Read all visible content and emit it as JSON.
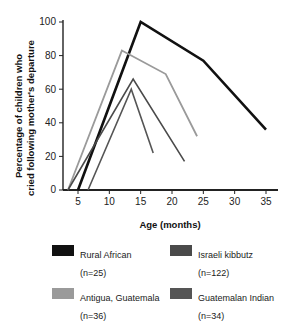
{
  "chart_data": {
    "type": "line",
    "title": "",
    "xlabel": "Age (months)",
    "ylabel": "Percentage of children who cried following mother's departure",
    "xlim": [
      2,
      36
    ],
    "ylim": [
      0,
      100
    ],
    "xticks": [
      5,
      10,
      15,
      20,
      25,
      30,
      35
    ],
    "yticks": [
      0,
      20,
      40,
      60,
      80,
      100
    ],
    "grid": false,
    "legend_position": "bottom",
    "series": [
      {
        "name": "Rural African",
        "n_label": "(n=25)",
        "color": "#111111",
        "width": 2.6,
        "points": [
          [
            5,
            0
          ],
          [
            15,
            100
          ],
          [
            25,
            77
          ],
          [
            35,
            36
          ]
        ]
      },
      {
        "name": "Antigua, Guatemala",
        "n_label": "(n=36)",
        "color": "#9a9a9a",
        "width": 1.8,
        "points": [
          [
            3.4,
            0
          ],
          [
            12,
            83
          ],
          [
            19,
            69
          ],
          [
            24,
            32
          ]
        ]
      },
      {
        "name": "Israeli kibbutz",
        "n_label": "(n=122)",
        "color": "#4a4a4a",
        "width": 1.6,
        "points": [
          [
            3.4,
            0
          ],
          [
            13.8,
            66
          ],
          [
            22,
            17
          ]
        ]
      },
      {
        "name": "Guatemalan Indian",
        "n_label": "(n=34)",
        "color": "#555555",
        "width": 1.6,
        "points": [
          [
            6.6,
            0
          ],
          [
            13.5,
            60
          ],
          [
            17,
            22
          ]
        ]
      }
    ]
  },
  "axes": {
    "x_title": "Age (months)",
    "y_title_line1": "Percentage of children who",
    "y_title_line2": "cried following mother's departure",
    "x_tick_labels": [
      "5",
      "10",
      "15",
      "20",
      "25",
      "30",
      "35"
    ],
    "y_tick_labels": [
      "0",
      "20",
      "40",
      "60",
      "80",
      "100"
    ]
  },
  "legend": {
    "items": [
      {
        "label": "Rural African",
        "n": "(n=25)",
        "color": "#111111"
      },
      {
        "label": "Israeli kibbutz",
        "n": "(n=122)",
        "color": "#4a4a4a"
      },
      {
        "label": "Antigua, Guatemala",
        "n": "(n=36)",
        "color": "#9a9a9a"
      },
      {
        "label": "Guatemalan Indian",
        "n": "(n=34)",
        "color": "#555555"
      }
    ]
  }
}
